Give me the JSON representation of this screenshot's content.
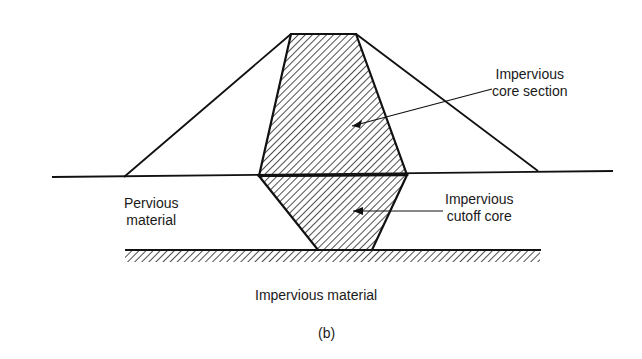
{
  "figure": {
    "caption": "(b)",
    "labels": {
      "core_section": [
        "Impervious",
        "core section"
      ],
      "cutoff_core": [
        "Impervious",
        "cutoff core"
      ],
      "pervious": [
        "Pervious",
        "material"
      ],
      "impervious_base": "Impervious material"
    }
  }
}
